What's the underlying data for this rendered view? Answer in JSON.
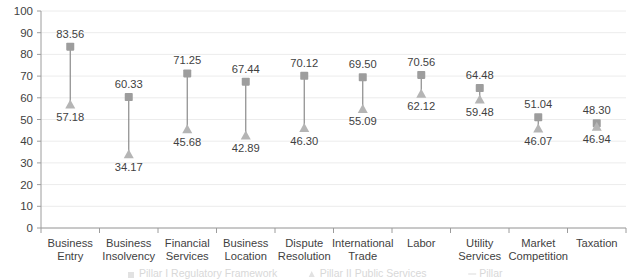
{
  "chart_data": {
    "type": "scatter",
    "subtype": "dumbbell-range",
    "title": "",
    "xlabel": "",
    "ylabel": "",
    "ylim": [
      0,
      100
    ],
    "ytick_step": 10,
    "yticks": [
      "0",
      "10",
      "20",
      "30",
      "40",
      "50",
      "60",
      "70",
      "80",
      "90",
      "100"
    ],
    "grid": true,
    "legend_position": "bottom",
    "categories": [
      "Business Entry",
      "Business Insolvency",
      "Financial Services",
      "Business Location",
      "Dispute Resolution",
      "International Trade",
      "Labor",
      "Utility Services",
      "Market Competition",
      "Taxation"
    ],
    "category_lines": [
      [
        "Business",
        "Entry"
      ],
      [
        "Business",
        "Insolvency"
      ],
      [
        "Financial",
        "Services"
      ],
      [
        "Business",
        "Location"
      ],
      [
        "Dispute",
        "Resolution"
      ],
      [
        "International",
        "Trade"
      ],
      [
        "Labor",
        ""
      ],
      [
        "Utility",
        "Services"
      ],
      [
        "Market",
        "Competition"
      ],
      [
        "Taxation",
        ""
      ]
    ],
    "series": [
      {
        "name": "Pillar I",
        "marker": "square",
        "color": "#9d9d9d",
        "values": [
          83.56,
          60.33,
          71.25,
          67.44,
          70.12,
          69.5,
          70.56,
          64.48,
          51.04,
          48.3
        ],
        "labels": [
          "83.56",
          "60.33",
          "71.25",
          "67.44",
          "70.12",
          "69.50",
          "70.56",
          "64.48",
          "51.04",
          "48.30"
        ]
      },
      {
        "name": "Pillar II",
        "marker": "triangle",
        "color": "#b5b5b5",
        "values": [
          57.18,
          34.17,
          45.68,
          42.89,
          46.3,
          55.09,
          62.12,
          59.48,
          46.07,
          46.94
        ],
        "labels": [
          "57.18",
          "34.17",
          "45.68",
          "42.89",
          "46.30",
          "55.09",
          "62.12",
          "59.48",
          "46.07",
          "46.94"
        ]
      }
    ],
    "value_label_placement": {
      "hi": [
        "above",
        "above",
        "above",
        "above",
        "above",
        "above",
        "above",
        "above",
        "above",
        "above"
      ],
      "lo": [
        "below",
        "below",
        "below",
        "below",
        "below",
        "below",
        "below",
        "below",
        "below",
        "below"
      ]
    },
    "legend": [
      {
        "label": "Pillar I Regulatory Framework",
        "marker": "square"
      },
      {
        "label": "Pillar II Public Services",
        "marker": "triangle"
      },
      {
        "label": "Pillar",
        "marker": "line"
      }
    ]
  }
}
